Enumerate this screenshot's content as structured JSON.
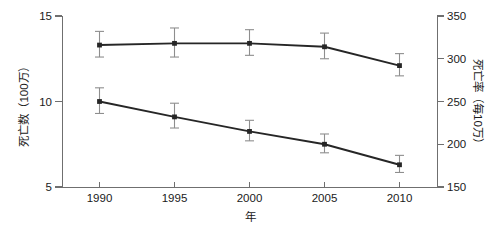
{
  "chart_data": {
    "type": "line",
    "title": "",
    "subtitle": "",
    "xlabel": "年",
    "ylabel": "死亡数（100万）",
    "y2label": "死亡率（毎10万）",
    "categories": [
      "1990",
      "1995",
      "2000",
      "2005",
      "2010"
    ],
    "x": [
      1990,
      1995,
      2000,
      2005,
      2010
    ],
    "xlim": [
      1987.5,
      2012.5
    ],
    "ylim": [
      5,
      15
    ],
    "y2lim": [
      150,
      350
    ],
    "yticks": [
      "5",
      "10",
      "15"
    ],
    "ytick_values": [
      5,
      10,
      15
    ],
    "y2ticks": [
      "150",
      "200",
      "250",
      "300",
      "350"
    ],
    "y2tick_values": [
      150,
      200,
      250,
      300,
      350
    ],
    "grid": false,
    "legend": "none",
    "error_bars": true,
    "series": [
      {
        "name": "死亡数（100万）",
        "axis": "left",
        "values": [
          13.3,
          13.4,
          13.4,
          13.2,
          12.1
        ],
        "err_low": [
          12.6,
          12.6,
          12.7,
          12.5,
          11.5
        ],
        "err_high": [
          14.1,
          14.3,
          14.2,
          14.0,
          12.8
        ],
        "marker": "square",
        "color": "#262626"
      },
      {
        "name": "死亡率（毎10万）",
        "axis": "right",
        "values": [
          250,
          232,
          215,
          200,
          176
        ],
        "err_low": [
          236,
          219,
          204,
          190,
          167
        ],
        "err_high": [
          266,
          248,
          228,
          212,
          187
        ],
        "marker": "square",
        "color": "#262626"
      }
    ],
    "annotations": []
  }
}
